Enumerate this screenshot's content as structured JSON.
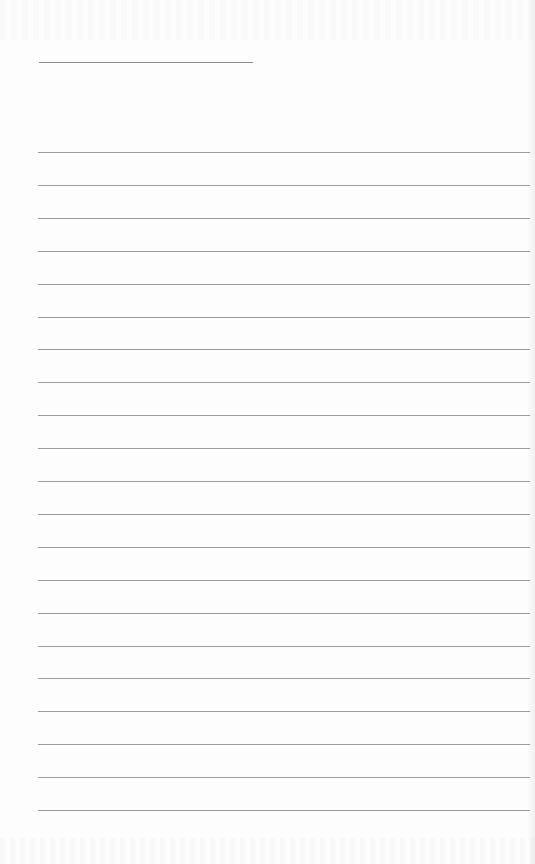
{
  "page": {
    "type": "blank lined sheet",
    "background_color": "#fdfdfd",
    "line_color": "#9a9a9a"
  },
  "header_rule": {
    "label": ""
  },
  "ruled_lines": {
    "count": 21,
    "first_y": 152,
    "spacing": 32.9,
    "entries": [
      "",
      "",
      "",
      "",
      "",
      "",
      "",
      "",
      "",
      "",
      "",
      "",
      "",
      "",
      "",
      "",
      "",
      "",
      "",
      "",
      ""
    ]
  }
}
